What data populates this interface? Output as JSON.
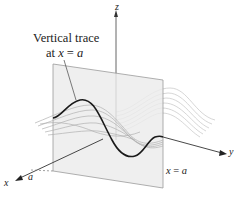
{
  "figure": {
    "annotation": {
      "title": "Vertical trace",
      "sub_prefix": "at ",
      "sub_var": "x",
      "sub_eq": " = ",
      "sub_val": "a"
    },
    "axes": {
      "x_label": "x",
      "y_label": "y",
      "z_label": "z",
      "tick_label": "a"
    },
    "plane_label": {
      "var": "x",
      "eq": " = ",
      "val": "a"
    },
    "colors": {
      "plane_fill": "#ececec",
      "plane_edge": "#9a9a9a",
      "trace_curve": "#1a1a1a",
      "surface_lines": "#b5b5b5",
      "axis": "#444444"
    }
  }
}
